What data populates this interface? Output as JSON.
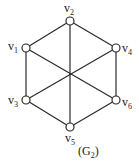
{
  "graph": {
    "caption": "(G2)",
    "caption_main": "(G",
    "caption_sub": "2",
    "caption_close": ")",
    "vertices": [
      {
        "id": "v1",
        "base": "v",
        "sub": "1",
        "x": 26,
        "y": 48,
        "lx": 8,
        "ly": 50
      },
      {
        "id": "v2",
        "base": "v",
        "sub": "2",
        "x": 70,
        "y": 21,
        "lx": 64,
        "ly": 12
      },
      {
        "id": "v3",
        "base": "v",
        "sub": "3",
        "x": 26,
        "y": 100,
        "lx": 8,
        "ly": 104
      },
      {
        "id": "v4",
        "base": "v",
        "sub": "4",
        "x": 116,
        "y": 48,
        "lx": 122,
        "ly": 52
      },
      {
        "id": "v5",
        "base": "v",
        "sub": "5",
        "x": 70,
        "y": 127,
        "lx": 65,
        "ly": 142
      },
      {
        "id": "v6",
        "base": "v",
        "sub": "6",
        "x": 116,
        "y": 100,
        "lx": 122,
        "ly": 106
      }
    ],
    "edges": [
      [
        "v1",
        "v2"
      ],
      [
        "v2",
        "v4"
      ],
      [
        "v4",
        "v6"
      ],
      [
        "v6",
        "v5"
      ],
      [
        "v5",
        "v3"
      ],
      [
        "v3",
        "v1"
      ],
      [
        "v2",
        "v5"
      ],
      [
        "v1",
        "v6"
      ],
      [
        "v4",
        "v3"
      ]
    ],
    "colors": {
      "stroke": "#2a2a2a",
      "fill": "#ffffff",
      "text": "#222222"
    }
  }
}
